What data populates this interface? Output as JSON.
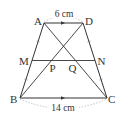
{
  "figure": {
    "type": "trapezoid-geometry",
    "points": {
      "A": {
        "label": "A",
        "x": 44,
        "y": 23
      },
      "D": {
        "label": "D",
        "x": 83,
        "y": 23
      },
      "B": {
        "label": "B",
        "x": 20,
        "y": 98
      },
      "C": {
        "label": "C",
        "x": 107,
        "y": 98
      },
      "M": {
        "label": "M",
        "x": 32,
        "y": 60.5
      },
      "N": {
        "label": "N",
        "x": 95,
        "y": 60.5
      },
      "P": {
        "label": "P",
        "x": 50.5,
        "y": 60.5
      },
      "Q": {
        "label": "Q",
        "x": 76.5,
        "y": 60.5
      }
    },
    "dimensions": {
      "top": "6 cm",
      "bottom": "14 cm"
    },
    "colors": {
      "line": "#333333",
      "dashed": "#aaaaaa",
      "text": "#333333"
    }
  }
}
